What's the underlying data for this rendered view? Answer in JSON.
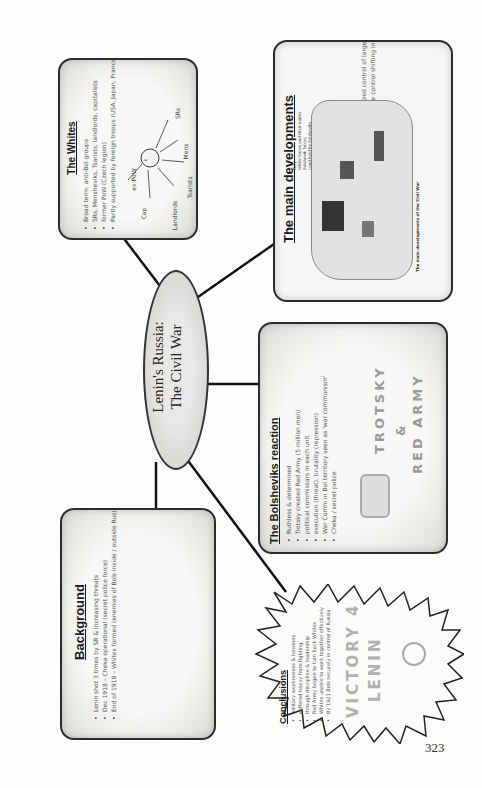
{
  "page": {
    "orientation": "rotated-90-ccw",
    "page_number": "323"
  },
  "center": {
    "line1": "Lenin's Russia:",
    "line2": "The Civil War"
  },
  "whites": {
    "title": "The Whites",
    "bullets": [
      "Broad term: anti-Bol groups",
      "SRs, Mensheviks, Tsarists, landlords, capitalists",
      "former PoW (Czech legion)",
      "Partly supported by foreign troops (USA, Japan, France, GB)"
    ],
    "diagram": {
      "center_icon": "face-sketch",
      "labels": [
        "SRs",
        "Mens",
        "Tsarists",
        "Landlords",
        "Cap",
        "ex-PoW"
      ]
    }
  },
  "main_developments": {
    "title": "The main developments",
    "bullets": [
      "March 1918 Czech legion seized control of large section of Trans-Siberian railway",
      "Zones of Bolshevik and White control shifting in Bol Russia"
    ],
    "map": {
      "key_label": "Key",
      "legend": [
        "White forces and their routes",
        "Bolshevik forces",
        "Land held by Bolsheviks"
      ],
      "caption": "The main developments of the Civil War"
    }
  },
  "bolsheviks": {
    "title": "The Bolsheviks reaction",
    "bullets": [
      "Ruthless & determined",
      "Trotsky created Red Army (5 million men)",
      "political commissars in each unit",
      "execution (threat), brutality (repression)",
      "War Comm in Bol territory seen as 'war communism'",
      "Cheka / secret police"
    ],
    "sketch_text": [
      "TROTSKY",
      "&",
      "RED ARMY"
    ]
  },
  "background": {
    "title": "Background",
    "bullets": [
      "Lenin shot 3 times by SR & increasing threats",
      "Dec 1918 – Cheka operational (secret police force)",
      "End of 1918 – Whites formed (enemies of Bols inside / outside Rus)"
    ]
  },
  "conclusions": {
    "title": "Conclusions",
    "bullets": [
      "military weaknesses & tensions",
      "suffered heavy from fighting",
      "through discipline & leadership",
      "Red Army began to turn back Whites",
      "Whites unable to work together effectively",
      "By 1921 Bols securely in control of Russia"
    ],
    "sketch_text": [
      "VICTORY 4",
      "LENIN"
    ]
  },
  "colors": {
    "line": "#111111",
    "box_border": "#2c2c2c",
    "highlight": "#9a9a9a",
    "sketch": "#999999"
  }
}
